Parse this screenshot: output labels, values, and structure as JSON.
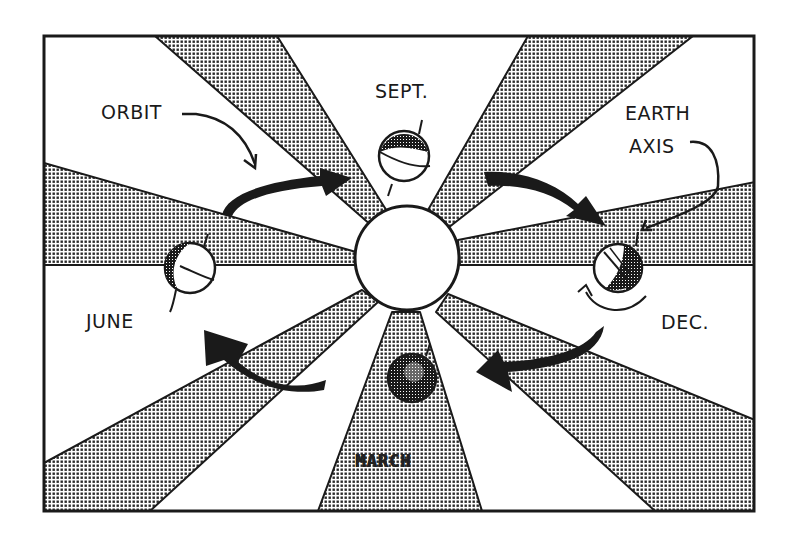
{
  "diagram": {
    "labels": {
      "orbit": "ORBIT",
      "sept": "SEPT.",
      "earth_axis_line1": "EARTH",
      "earth_axis_line2": "AXIS",
      "june": "JUNE",
      "dec": "DEC.",
      "march": "MARCH"
    },
    "colors": {
      "ink": "#1a1a1a",
      "paper": "#ffffff",
      "stipple": "#2a2a2a"
    },
    "elements": {
      "sun": "sun-circle",
      "globes": [
        "globe-sept",
        "globe-dec",
        "globe-march",
        "globe-june"
      ],
      "orbit_arrows": [
        "arrow-june-to-sept",
        "arrow-sept-to-dec",
        "arrow-dec-to-march",
        "arrow-march-to-june"
      ],
      "rays": 8
    }
  }
}
